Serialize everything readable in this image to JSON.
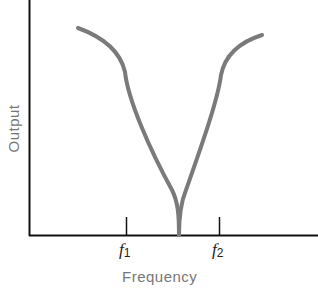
{
  "diagram": {
    "ylabel": "Output",
    "xlabel": "Frequency",
    "ticks": [
      {
        "base": "f",
        "sub": "1",
        "x": 126
      },
      {
        "base": "f",
        "sub": "2",
        "x": 219
      }
    ],
    "colors": {
      "axis": "#111111",
      "curve": "#7a7a7a",
      "label": "#777777"
    }
  }
}
